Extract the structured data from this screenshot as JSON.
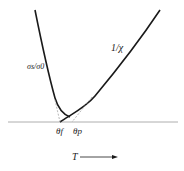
{
  "diagram": {
    "curves": {
      "left_label": "σs/σ0",
      "right_label": "1/χ"
    },
    "axis": {
      "theta_f": "θf",
      "theta_p": "θp",
      "x_label": "T"
    },
    "colors": {
      "line": "#1a1a1a",
      "axis": "#888888",
      "dashed": "#999999"
    }
  }
}
